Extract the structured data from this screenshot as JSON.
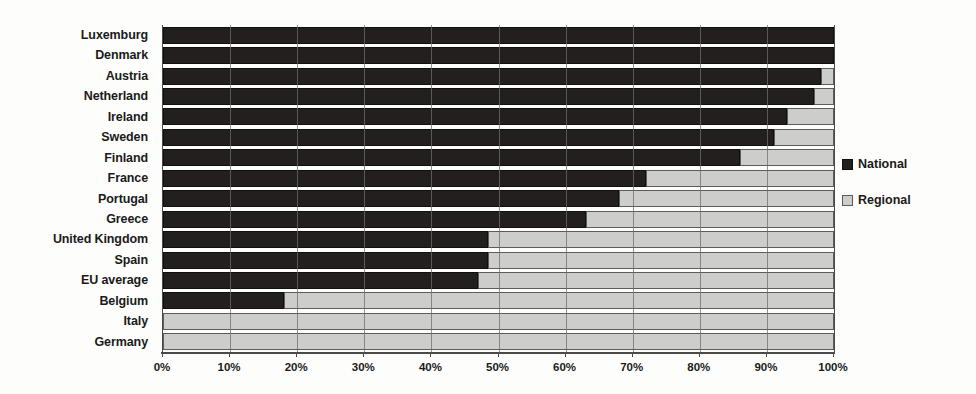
{
  "chart_data": {
    "type": "bar",
    "orientation": "horizontal",
    "stacked": true,
    "stack_total": 100,
    "title": "",
    "subtitle": "",
    "xlabel": "",
    "ylabel": "",
    "xlim": [
      0,
      100
    ],
    "grid": true,
    "legend_position": "right",
    "x_ticks": [
      0,
      10,
      20,
      30,
      40,
      50,
      60,
      70,
      80,
      90,
      100
    ],
    "x_tick_labels": [
      "0%",
      "10%",
      "20%",
      "30%",
      "40%",
      "50%",
      "60%",
      "70%",
      "80%",
      "90%",
      "100%"
    ],
    "categories": [
      "Luxemburg",
      "Denmark",
      "Austria",
      "Netherland",
      "Ireland",
      "Sweden",
      "Finland",
      "France",
      "Portugal",
      "Greece",
      "United Kingdom",
      "Spain",
      "EU average",
      "Belgium",
      "Italy",
      "Germany"
    ],
    "series": [
      {
        "name": "National",
        "color": "#221f1e",
        "values": [
          100,
          100,
          98,
          97,
          93,
          91,
          86,
          72,
          68,
          63,
          48.5,
          48.5,
          47,
          18,
          0,
          0
        ]
      },
      {
        "name": "Regional",
        "color": "#cdcdcb",
        "values": [
          0,
          0,
          2,
          3,
          7,
          9,
          14,
          28,
          32,
          37,
          51.5,
          51.5,
          53,
          82,
          100,
          100
        ]
      }
    ]
  },
  "legend": {
    "items": [
      {
        "label": "National",
        "swatch": "national"
      },
      {
        "label": "Regional",
        "swatch": "regional"
      }
    ]
  },
  "colors": {
    "national": "#221f1e",
    "regional": "#cdcdcb",
    "axis": "#4a4a4a",
    "grid": "#6e6e6e",
    "text": "#1a1a1a",
    "background": "#fdfdfc"
  }
}
